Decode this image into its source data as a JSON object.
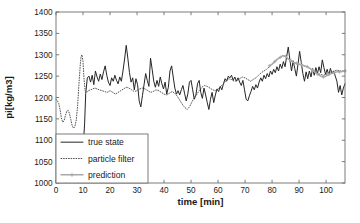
{
  "chart_data": {
    "type": "line",
    "title": "",
    "xlabel": "time [min]",
    "ylabel": "pi[kg/m3]",
    "xlim": [
      0,
      107
    ],
    "ylim": [
      1000,
      1400
    ],
    "xticks": [
      0,
      10,
      20,
      30,
      40,
      50,
      60,
      70,
      80,
      90,
      100
    ],
    "yticks": [
      1000,
      1050,
      1100,
      1150,
      1200,
      1250,
      1300,
      1350,
      1400
    ],
    "xtick_labels": [
      "0",
      "10",
      "20",
      "30",
      "40",
      "50",
      "60",
      "70",
      "80",
      "90",
      "100"
    ],
    "ytick_labels": [
      "1000",
      "1050",
      "1100",
      "1150",
      "1200",
      "1250",
      "1300",
      "1350",
      "1400"
    ],
    "grid": false,
    "legend_position": "lower left",
    "legend": [
      "true state",
      "particle filter",
      "prediction"
    ],
    "colors": {
      "true_state": "#242424",
      "particle_filter": "#4a4a4a",
      "prediction": "#a8a8a8",
      "axis": "#6e6e6e",
      "background": "#ffffff"
    },
    "series": [
      {
        "name": "true state",
        "style": "solid",
        "x": [
          10.2,
          10.6,
          11.0,
          11.6,
          12.2,
          12.8,
          13.4,
          14.0,
          14.6,
          15.2,
          15.8,
          16.4,
          17.0,
          17.6,
          18.2,
          18.8,
          19.4,
          20.0,
          20.6,
          21.2,
          21.8,
          22.4,
          23.0,
          23.6,
          24.2,
          24.8,
          25.4,
          26.0,
          26.6,
          27.2,
          27.8,
          28.4,
          29.0,
          29.6,
          30.2,
          30.8,
          31.4,
          32.0,
          32.6,
          33.2,
          33.8,
          34.4,
          35.0,
          35.6,
          36.2,
          36.8,
          37.4,
          38.0,
          38.6,
          39.2,
          39.8,
          40.4,
          41.0,
          41.6,
          42.2,
          42.8,
          43.4,
          44.0,
          44.6,
          45.2,
          45.8,
          46.4,
          47.0,
          47.6,
          48.2,
          48.8,
          49.4,
          50.0,
          50.6,
          51.2,
          51.8,
          52.4,
          53.0,
          53.6,
          54.2,
          54.8,
          55.4,
          56.0,
          56.6,
          57.2,
          57.8,
          58.4,
          59.0,
          59.6,
          60.2,
          60.8,
          61.4,
          62.0,
          62.6,
          63.2,
          63.8,
          64.4,
          65.0,
          65.6,
          66.2,
          66.8,
          67.4,
          68.0,
          68.6,
          69.2,
          69.8,
          70.4,
          71.0,
          71.6,
          72.2,
          72.8,
          73.4,
          74.0,
          74.6,
          75.2,
          75.8,
          76.4,
          77.0,
          77.6,
          78.2,
          78.8,
          79.4,
          80.0,
          80.6,
          81.2,
          81.8,
          82.4,
          83.0,
          83.6,
          84.2,
          84.8,
          85.4,
          86.0,
          86.6,
          87.2,
          87.8,
          88.4,
          89.0,
          89.6,
          90.2,
          90.8,
          91.4,
          92.0,
          92.6,
          93.2,
          93.8,
          94.4,
          95.0,
          95.6,
          96.2,
          96.8,
          97.4,
          98.0,
          98.6,
          99.2,
          99.8,
          100.4,
          101.0,
          101.6,
          102.2,
          102.8,
          103.4,
          104.0,
          104.6,
          105.2,
          105.8,
          106.4,
          107.0
        ],
        "y": [
          1098,
          1140,
          1210,
          1246,
          1250,
          1236,
          1252,
          1230,
          1262,
          1248,
          1238,
          1255,
          1242,
          1260,
          1274,
          1252,
          1236,
          1228,
          1246,
          1238,
          1252,
          1240,
          1232,
          1248,
          1238,
          1262,
          1290,
          1322,
          1292,
          1258,
          1236,
          1246,
          1218,
          1244,
          1230,
          1192,
          1178,
          1204,
          1230,
          1256,
          1240,
          1226,
          1292,
          1266,
          1238,
          1224,
          1240,
          1226,
          1248,
          1232,
          1220,
          1236,
          1208,
          1224,
          1262,
          1274,
          1248,
          1222,
          1208,
          1216,
          1206,
          1218,
          1228,
          1210,
          1192,
          1208,
          1236,
          1240,
          1218,
          1196,
          1206,
          1232,
          1240,
          1212,
          1198,
          1222,
          1206,
          1188,
          1172,
          1196,
          1212,
          1188,
          1206,
          1220,
          1214,
          1226,
          1218,
          1232,
          1244,
          1238,
          1250,
          1246,
          1252,
          1240,
          1248,
          1238,
          1246,
          1236,
          1228,
          1240,
          1218,
          1196,
          1192,
          1204,
          1214,
          1226,
          1218,
          1230,
          1222,
          1236,
          1246,
          1238,
          1252,
          1244,
          1256,
          1248,
          1262,
          1254,
          1266,
          1258,
          1272,
          1262,
          1278,
          1268,
          1284,
          1272,
          1296,
          1318,
          1288,
          1262,
          1286,
          1268,
          1250,
          1278,
          1308,
          1282,
          1256,
          1238,
          1260,
          1244,
          1262,
          1248,
          1268,
          1252,
          1270,
          1256,
          1272,
          1258,
          1288,
          1270,
          1254,
          1266,
          1252,
          1268,
          1256,
          1262,
          1250,
          1238,
          1212,
          1228,
          1206,
          1222,
          1232
        ]
      },
      {
        "name": "particle filter",
        "style": "dotted",
        "x": [
          0.0,
          0.5,
          1.0,
          1.5,
          2.0,
          2.5,
          3.0,
          3.5,
          4.0,
          4.5,
          5.0,
          5.5,
          6.0,
          6.5,
          7.0,
          7.5,
          8.0,
          8.5,
          9.0,
          9.3,
          9.6,
          10.0,
          10.4,
          10.8,
          11.4,
          12.0,
          12.8,
          13.6,
          14.4,
          15.2,
          16.0,
          17.0,
          18.0,
          19.0,
          20.0,
          21.0,
          22.0,
          23.0,
          24.0,
          25.0,
          26.0,
          27.0,
          28.0,
          29.0,
          30.0,
          31.0,
          32.0,
          33.0,
          34.0,
          35.0,
          36.0,
          37.0,
          38.0,
          39.0,
          40.0,
          41.0,
          42.0,
          43.0,
          44.0,
          45.0,
          46.0,
          47.0,
          47.8,
          48.6,
          49.4,
          50.2,
          51.0,
          52.0,
          53.0,
          54.0,
          55.0,
          56.0,
          57.0,
          58.0,
          59.0,
          60.0,
          61.0,
          62.0,
          63.0,
          64.0,
          65.0,
          66.0,
          67.0,
          68.0,
          69.0,
          70.0,
          71.0,
          72.0,
          73.0,
          74.0,
          75.0,
          76.0,
          77.0,
          78.0,
          79.0,
          80.0,
          81.0,
          82.0,
          83.0,
          84.0,
          85.0,
          86.0,
          87.0,
          88.0,
          89.0,
          90.0,
          91.0,
          92.0,
          93.0,
          94.0,
          95.0,
          96.0,
          97.0,
          98.0,
          99.0,
          100.0,
          101.0,
          102.0,
          103.0,
          104.0,
          105.0,
          106.0,
          107.0
        ],
        "y": [
          1196,
          1193,
          1186,
          1172,
          1152,
          1142,
          1146,
          1158,
          1168,
          1170,
          1162,
          1148,
          1134,
          1128,
          1132,
          1148,
          1180,
          1232,
          1278,
          1296,
          1300,
          1284,
          1242,
          1216,
          1212,
          1216,
          1218,
          1220,
          1222,
          1220,
          1218,
          1216,
          1214,
          1212,
          1216,
          1212,
          1208,
          1212,
          1216,
          1220,
          1224,
          1222,
          1218,
          1214,
          1216,
          1220,
          1222,
          1220,
          1216,
          1212,
          1214,
          1218,
          1216,
          1212,
          1208,
          1206,
          1210,
          1214,
          1210,
          1202,
          1192,
          1182,
          1176,
          1172,
          1178,
          1188,
          1198,
          1206,
          1216,
          1224,
          1228,
          1226,
          1222,
          1218,
          1216,
          1220,
          1226,
          1232,
          1240,
          1244,
          1242,
          1238,
          1240,
          1244,
          1248,
          1246,
          1242,
          1238,
          1242,
          1246,
          1252,
          1258,
          1262,
          1266,
          1272,
          1278,
          1284,
          1290,
          1294,
          1298,
          1296,
          1290,
          1286,
          1282,
          1280,
          1278,
          1276,
          1274,
          1272,
          1268,
          1264,
          1260,
          1256,
          1254,
          1252,
          1254,
          1258,
          1260,
          1262,
          1264,
          1262,
          1262,
          1262
        ]
      },
      {
        "name": "prediction",
        "style": "dash-plus",
        "x": [
          79.0,
          80.0,
          81.0,
          82.0,
          83.0,
          84.0,
          85.0,
          86.0,
          87.0,
          88.0,
          89.0,
          90.0,
          91.0,
          92.0,
          93.0,
          94.0,
          95.0,
          96.0,
          97.0,
          98.0,
          99.0,
          100.0,
          101.0,
          102.0,
          103.0,
          104.0,
          105.0,
          106.0,
          107.0
        ],
        "y": [
          1274,
          1278,
          1284,
          1290,
          1294,
          1298,
          1296,
          1290,
          1286,
          1282,
          1280,
          1278,
          1276,
          1274,
          1272,
          1268,
          1264,
          1258,
          1254,
          1250,
          1248,
          1250,
          1254,
          1256,
          1258,
          1260,
          1260,
          1261,
          1262
        ]
      }
    ]
  },
  "layout": {
    "plot_left": 56,
    "plot_top": 12,
    "plot_right": 345,
    "plot_bottom": 183,
    "legend": {
      "x": 56,
      "y": 134,
      "width": 92,
      "height": 49
    }
  }
}
